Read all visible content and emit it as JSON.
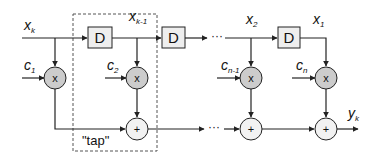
{
  "diagram": {
    "type": "FIR filter block diagram (tapped delay line)",
    "input": {
      "label": "x",
      "sub": "k"
    },
    "output": {
      "label": "y",
      "sub": "k"
    },
    "delays": [
      {
        "label": "D"
      },
      {
        "label": "D"
      },
      {
        "label": "D"
      }
    ],
    "taps": [
      {
        "signal": {
          "label": "x",
          "sub": "k"
        },
        "coef": {
          "label": "c",
          "sub": "1"
        }
      },
      {
        "signal": {
          "label": "x",
          "sub": "k-1"
        },
        "coef": {
          "label": "c",
          "sub": "2"
        }
      },
      {
        "signal": {
          "label": "x",
          "sub": "2"
        },
        "coef": {
          "label": "c",
          "sub": "n-1"
        }
      },
      {
        "signal": {
          "label": "x",
          "sub": "1"
        },
        "coef": {
          "label": "c",
          "sub": "n"
        }
      }
    ],
    "multiplier_symbol": "x",
    "adder_symbol": "+",
    "ellipsis": "···",
    "tap_annotation": "\"tap\"",
    "colors": {
      "line": "#222222",
      "box_fill": "#eeeeee",
      "multiplier_fill": "#cccccc",
      "adder_fill": "#f2f2f2",
      "dashed_border": "#555555"
    }
  }
}
